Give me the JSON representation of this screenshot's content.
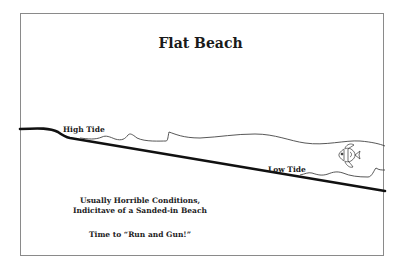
{
  "title": "Flat Beach",
  "labels": {
    "high_tide": "High Tide",
    "low_tide": "Low Tide"
  },
  "captions": {
    "line1": "Usually Horrible Conditions,",
    "line2": "Indicitave of a Sanded-in Beach",
    "line3": "Time to “Run and Gun!”"
  },
  "icons": {
    "fish": "fish-icon"
  },
  "colors": {
    "stroke": "#111111",
    "wave": "#444444",
    "frame": "#8a8a8a"
  }
}
